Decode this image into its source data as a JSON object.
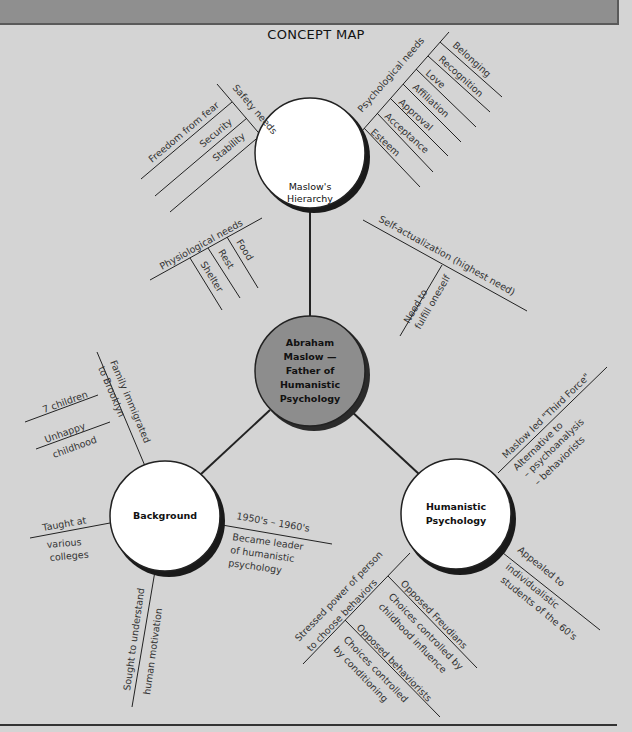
{
  "title": "CONCEPT MAP",
  "colors": {
    "background": "#d4d4d4",
    "banner": "#8f8f8f",
    "center_node": "#8d8d8d",
    "node_fill": "#ffffff",
    "line": "#222222"
  },
  "center": {
    "lines": [
      "Abraham",
      "Maslow —",
      "Father of",
      "Humanistic",
      "Psychology"
    ]
  },
  "nodes": {
    "hierarchy": {
      "lines": [
        "Maslow's",
        "Hierarchy"
      ]
    },
    "background": {
      "lines": [
        "Background"
      ]
    },
    "humanistic": {
      "lines": [
        "Humanistic",
        "Psychology"
      ]
    }
  },
  "hierarchy_branches": {
    "psychological": {
      "label": "Psychological needs",
      "items": [
        "Belonging",
        "Recognition",
        "Love",
        "Affiliation",
        "Approval",
        "Acceptance",
        "Esteem"
      ]
    },
    "safety": {
      "label": "Safety needs",
      "items": [
        "Freedom from fear",
        "Security",
        "Stability"
      ]
    },
    "physiological": {
      "label": "Physiological needs",
      "items": [
        "Food",
        "Rest",
        "Shelter"
      ]
    },
    "self_actualization": {
      "label": "Self-actualization (highest need)",
      "items": [
        "Need to",
        "fulfill oneself"
      ]
    }
  },
  "background_branches": {
    "family": {
      "label": "Family immigrated",
      "label2": "to Brooklyn",
      "items": [
        "7 children",
        "Unhappy",
        "childhood"
      ]
    },
    "taught": {
      "label": "Taught at",
      "sub": [
        "various",
        "colleges"
      ]
    },
    "sought": {
      "label": "Sought to understand",
      "label2": "human motivation"
    },
    "leader": {
      "label": "1950's – 1960's",
      "sub": [
        "Became leader",
        "of humanistic",
        "psychology"
      ]
    }
  },
  "humanistic_branches": {
    "third_force": {
      "label": "Maslow led \"Third Force\"",
      "sub": [
        "Alternative to",
        "– psychoanalysis",
        "– behaviorists"
      ]
    },
    "appealed": {
      "label": "Appealed to",
      "sub": [
        "individualistic",
        "students of the 60's"
      ]
    },
    "stressed": {
      "label": "Stressed power of person",
      "label2": "to choose behaviors",
      "items": [
        {
          "label": "Opposed Freudians",
          "sub": [
            "Choices controlled by",
            "childhood influence"
          ]
        },
        {
          "label": "Opposed behaviorists",
          "sub": [
            "Choices controlled",
            "by conditioning"
          ]
        }
      ]
    }
  }
}
